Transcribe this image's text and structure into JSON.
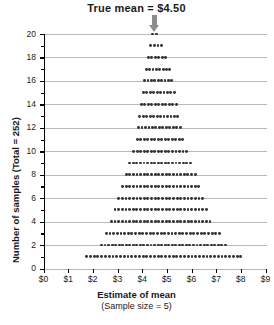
{
  "annotation": {
    "text": "True mean  =  $4.50",
    "value": 4.5,
    "arrow_icon": "down-arrow-icon",
    "color": "#8d8d8d"
  },
  "axes": {
    "y_title": "Number of samples (Total = 252)",
    "x_title": "Estimate of mean",
    "x_subtitle": "(Sample size = 5)",
    "y_ticks": [
      "0",
      "2",
      "4",
      "6",
      "8",
      "10",
      "12",
      "14",
      "16",
      "18",
      "20"
    ],
    "x_ticks": [
      "$0",
      "$1",
      "$2",
      "$3",
      "$4",
      "$5",
      "$6",
      "$7",
      "$8",
      "$9"
    ]
  },
  "chart_data": {
    "type": "bar",
    "title": "True mean  =  $4.50",
    "subtitle": "(Sample size = 5)",
    "xlabel": "Estimate of mean",
    "ylabel": "Number of samples (Total = 252)",
    "xlim": [
      0,
      9
    ],
    "ylim": [
      0,
      20
    ],
    "ytick_step": 2,
    "grid": true,
    "grid_axis": "y",
    "total_samples": 252,
    "true_mean": 4.5,
    "sample_size": 5,
    "dot_diameter_dollars": 0.16,
    "rows": [
      {
        "count": 1,
        "n_dots": 42,
        "x_start": 1.75,
        "x_end": 8.0
      },
      {
        "count": 2,
        "n_dots": 36,
        "x_start": 2.35,
        "x_end": 7.37
      },
      {
        "count": 3,
        "n_dots": 32,
        "x_start": 2.55,
        "x_end": 7.13
      },
      {
        "count": 4,
        "n_dots": 28,
        "x_start": 2.75,
        "x_end": 6.75
      },
      {
        "count": 5,
        "n_dots": 26,
        "x_start": 2.9,
        "x_end": 6.6
      },
      {
        "count": 6,
        "n_dots": 24,
        "x_start": 3.05,
        "x_end": 6.45
      },
      {
        "count": 7,
        "n_dots": 22,
        "x_start": 3.2,
        "x_end": 6.3
      },
      {
        "count": 8,
        "n_dots": 20,
        "x_start": 3.35,
        "x_end": 6.15
      },
      {
        "count": 9,
        "n_dots": 18,
        "x_start": 3.5,
        "x_end": 5.95
      },
      {
        "count": 10,
        "n_dots": 16,
        "x_start": 3.65,
        "x_end": 5.8
      },
      {
        "count": 11,
        "n_dots": 14,
        "x_start": 3.8,
        "x_end": 5.65
      },
      {
        "count": 12,
        "n_dots": 13,
        "x_start": 3.85,
        "x_end": 5.55
      },
      {
        "count": 13,
        "n_dots": 12,
        "x_start": 3.9,
        "x_end": 5.45
      },
      {
        "count": 14,
        "n_dots": 11,
        "x_start": 3.97,
        "x_end": 5.38
      },
      {
        "count": 15,
        "n_dots": 10,
        "x_start": 4.05,
        "x_end": 5.3
      },
      {
        "count": 16,
        "n_dots": 9,
        "x_start": 4.1,
        "x_end": 5.2
      },
      {
        "count": 17,
        "n_dots": 8,
        "x_start": 4.17,
        "x_end": 5.12
      },
      {
        "count": 18,
        "n_dots": 6,
        "x_start": 4.25,
        "x_end": 4.95
      },
      {
        "count": 19,
        "n_dots": 4,
        "x_start": 4.33,
        "x_end": 4.8
      },
      {
        "count": 20,
        "n_dots": 2,
        "x_start": 4.42,
        "x_end": 4.58
      }
    ]
  }
}
